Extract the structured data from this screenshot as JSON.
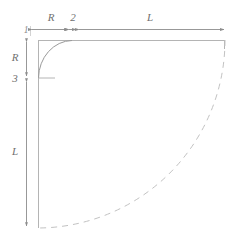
{
  "diagram": {
    "colors": {
      "outline": "#b4b4b4",
      "arc_solid": "#9a9a9a",
      "arc_dashed": "#c2c2c2",
      "dimension_line": "#8c8c8c",
      "label_text": "#6f6f6f",
      "label_text_small": "#8a8a8a",
      "background": "#ffffff"
    },
    "labels": {
      "corner_index": "1",
      "top_radius": "R",
      "top_gap": "2",
      "top_length": "L",
      "left_radius": "R",
      "left_index": "3",
      "left_length": "L"
    },
    "dimensions": {
      "top": [
        {
          "name": "R",
          "value": "R",
          "x_start": 30,
          "x_end": 70,
          "y": 29
        },
        {
          "name": "2",
          "value": "2",
          "x_start": 67,
          "x_end": 77,
          "y": 29
        },
        {
          "name": "L",
          "value": "L",
          "x_start": 77,
          "x_end": 225,
          "y": 29
        }
      ],
      "left": [
        {
          "name": "R",
          "value": "R",
          "y_start": 40,
          "y_end": 78,
          "x": 26
        },
        {
          "name": "L",
          "value": "L",
          "y_start": 80,
          "y_end": 228,
          "x": 26
        }
      ]
    },
    "geometry": {
      "left_edge_x": 38,
      "top_edge_y": 40,
      "right_edge_x": 225,
      "bottom_y": 228,
      "fillet_radius": 34,
      "fillet_top_x": 72,
      "fillet_left_y": 78,
      "large_arc_start_x": 225,
      "large_arc_start_y": 40,
      "large_arc_end_x": 38,
      "large_arc_end_y": 228
    }
  }
}
